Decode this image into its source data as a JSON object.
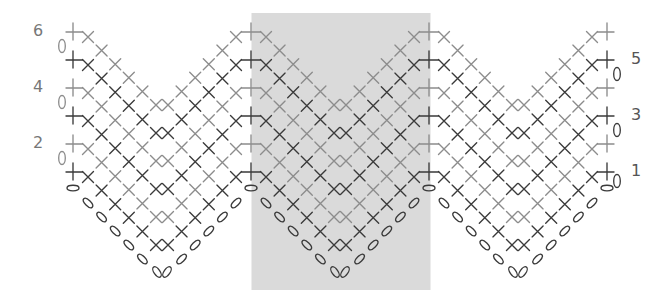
{
  "chart": {
    "type": "crochet-chart",
    "rows": [
      {
        "number": 1,
        "label": "1",
        "side": "right",
        "tone": "dark"
      },
      {
        "number": 2,
        "label": "2",
        "side": "left",
        "tone": "light"
      },
      {
        "number": 3,
        "label": "3",
        "side": "right",
        "tone": "dark"
      },
      {
        "number": 4,
        "label": "4",
        "side": "left",
        "tone": "light"
      },
      {
        "number": 5,
        "label": "5",
        "side": "right",
        "tone": "dark"
      },
      {
        "number": 6,
        "label": "6",
        "side": "left",
        "tone": "light"
      }
    ],
    "repeats": 3,
    "highlighted_repeat": 2,
    "stitches_per_diagonal": 6,
    "foundation_chains_per_diagonal": 5,
    "symbols": {
      "stitch": "cross (X)",
      "peak_stitch": "plus (+)",
      "foundation_chain": "oval",
      "turning_chain": "oval (0)"
    },
    "colors": {
      "dark": "#3a3a3a",
      "light": "#8c8c8c",
      "highlight_fill": "#dadada",
      "label_dark": "#555555",
      "label_light": "#777777",
      "background": "#ffffff"
    }
  }
}
